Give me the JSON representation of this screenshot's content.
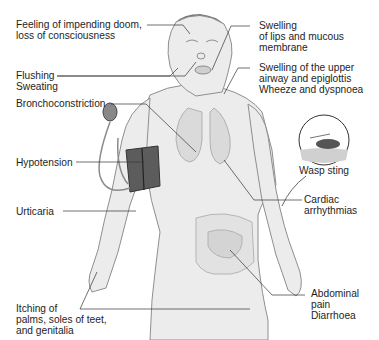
{
  "diagram": {
    "labels": {
      "doom": "Feeling of impending doom,\nloss of consciousness",
      "flushing": "Flushing\nSweating",
      "broncho": "Bronchoconstriction",
      "hypotension": "Hypotension",
      "urticaria": "Urticaria",
      "itching": "Itching of\npalms, soles of teet,\nand genitalia",
      "lips": "Swelling\nof lips and mucous\nmembrane",
      "airway": "Swelling of the upper\nairway and epiglottis\nWheeze and dyspnoea",
      "wasp": "Wasp sting",
      "cardiac": "Cardiac\narrhythmias",
      "abdominal": "Abdominal\npain\nDiarrhoea"
    },
    "colors": {
      "skin": "#ececec",
      "outline": "#8a8a8a",
      "organ": "#dcdcdc",
      "cuff": "#5a5a5a",
      "leader": "#333333"
    }
  }
}
